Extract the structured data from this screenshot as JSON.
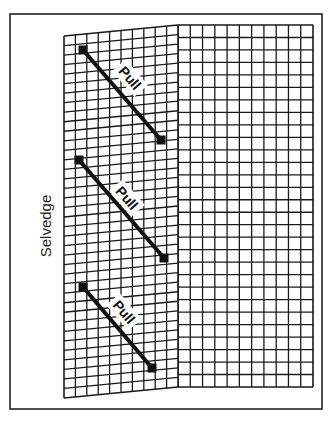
{
  "figure": {
    "type": "fabric-grain-diagram",
    "labels": {
      "side_label": "Selvedge",
      "arrows": [
        {
          "label": "Pull",
          "from": [
            83,
            50
          ],
          "to": [
            161,
            140
          ],
          "label_pos": [
            130,
            78
          ]
        },
        {
          "label": "Pull",
          "from": [
            79,
            160
          ],
          "to": [
            164,
            258
          ],
          "label_pos": [
            127,
            198
          ]
        },
        {
          "label": "Pull",
          "from": [
            83,
            287
          ],
          "to": [
            152,
            368
          ],
          "label_pos": [
            124,
            312
          ]
        }
      ]
    },
    "colors": {
      "ink": "#111111",
      "background": "#ffffff"
    },
    "panels": {
      "left_distorted": {
        "columns": 10,
        "description": "bias-distorted grid near selvedge"
      },
      "right_straight": {
        "columns": 11,
        "description": "straight-grain grid"
      }
    }
  }
}
